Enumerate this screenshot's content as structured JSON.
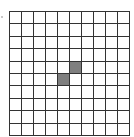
{
  "grid": {
    "rows": 10,
    "cols": 10,
    "line_color": "#333333",
    "fill_color": "#ffffff",
    "shade_color": "#7f7f7f",
    "shaded_cells": [
      {
        "row": 4,
        "col": 5
      },
      {
        "row": 5,
        "col": 4
      }
    ]
  }
}
